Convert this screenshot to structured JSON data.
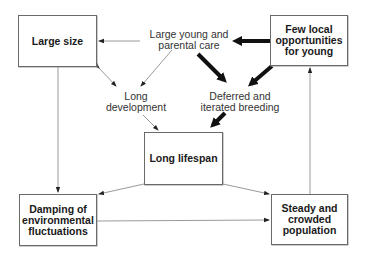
{
  "boxes": {
    "large_size": "Large size",
    "few_local": "Few local\nopportunities\nfor young",
    "long_lifespan": "Long lifespan",
    "damping": "Damping of\nenvironmental\nfluctuations",
    "steady": "Steady and\ncrowded\npopulation"
  },
  "labels": {
    "parental_care": "Large young and\nparental care",
    "long_development": "Long\ndevelopment",
    "deferred_breeding": "Deferred and\niterated breeding"
  },
  "colors": {
    "thin_arrow": "#9a9a9a",
    "thick_arrow": "#111111",
    "box_border": "#6a6a6a"
  }
}
